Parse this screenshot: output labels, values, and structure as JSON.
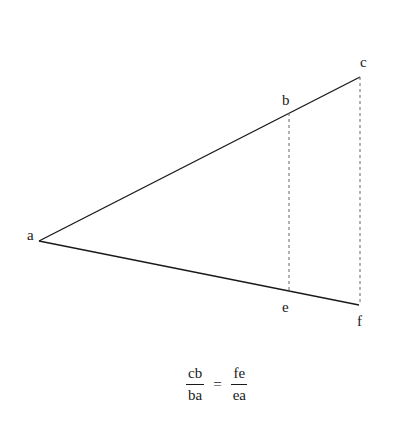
{
  "diagram": {
    "type": "similar-triangles",
    "colors": {
      "line": "#1a1a1a",
      "dashed": "#666666",
      "background": "#ffffff"
    },
    "points": {
      "a": {
        "label": "a",
        "x": 39,
        "y": 241
      },
      "b": {
        "label": "b",
        "x": 289,
        "y": 113
      },
      "c": {
        "label": "c",
        "x": 360,
        "y": 77
      },
      "e": {
        "label": "e",
        "x": 289,
        "y": 292
      },
      "f": {
        "label": "f",
        "x": 359,
        "y": 305
      }
    },
    "segments": [
      {
        "from": "a",
        "to": "c",
        "style": "solid"
      },
      {
        "from": "a",
        "to": "f",
        "style": "solid"
      },
      {
        "from": "b",
        "to": "e",
        "style": "dashed"
      },
      {
        "from": "c",
        "to": "f",
        "style": "dashed"
      }
    ]
  },
  "labels": {
    "a": "a",
    "b": "b",
    "c": "c",
    "e": "e",
    "f": "f"
  },
  "formula": {
    "left": {
      "numerator": "cb",
      "denominator": "ba"
    },
    "operator": "=",
    "right": {
      "numerator": "fe",
      "denominator": "ea"
    }
  }
}
